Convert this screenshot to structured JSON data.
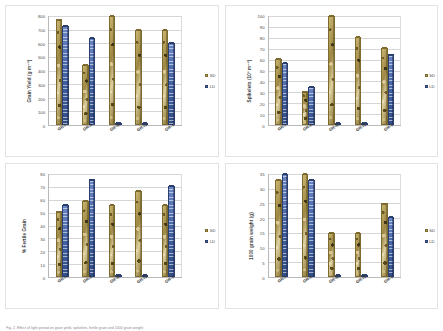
{
  "figure": {
    "caption": "Fig. 2. Effect of light period on grain yield, spikelets, fertile grain and 1000 grain weight",
    "legend": {
      "sd": "SD",
      "ld": "LD"
    },
    "categories": [
      "GR-I",
      "GR-II",
      "GR-III",
      "GR-IV",
      "GR-V"
    ],
    "colors": {
      "sd": "#b59a52",
      "ld": "#4a68a8",
      "grid": "#d6d6d6",
      "axis": "#b8b8b8"
    }
  },
  "chart_data": [
    {
      "type": "bar",
      "panel": "top-left",
      "title": "",
      "ylabel": "Grain Yield (g m⁻²)",
      "xlabel": "",
      "categories": [
        "GR-I",
        "GR-II",
        "GR-III",
        "GR-IV",
        "GR-V"
      ],
      "series": [
        {
          "name": "SD",
          "values": [
            775,
            440,
            800,
            700,
            700
          ]
        },
        {
          "name": "LD",
          "values": [
            730,
            640,
            5,
            5,
            605
          ]
        }
      ],
      "ylim": [
        0,
        800
      ],
      "yticks": [
        0,
        100,
        200,
        300,
        400,
        500,
        600,
        700,
        800
      ],
      "grid": true,
      "legend_position": "right"
    },
    {
      "type": "bar",
      "panel": "top-right",
      "title": "",
      "ylabel": "Spikelets (10³ m⁻²)",
      "xlabel": "",
      "categories": [
        "GR-I",
        "GR-II",
        "GR-III",
        "GR-IV",
        "GR-V"
      ],
      "series": [
        {
          "name": "SD",
          "values": [
            61,
            31,
            100,
            81,
            71
          ]
        },
        {
          "name": "LD",
          "values": [
            57,
            35,
            1,
            1,
            65
          ]
        }
      ],
      "ylim": [
        0,
        100
      ],
      "yticks": [
        0,
        10,
        20,
        30,
        40,
        50,
        60,
        70,
        80,
        90,
        100
      ],
      "grid": true,
      "legend_position": "right"
    },
    {
      "type": "bar",
      "panel": "bottom-left",
      "title": "",
      "ylabel": "% Fertile Grain",
      "xlabel": "",
      "categories": [
        "GR-I",
        "GR-II",
        "GR-III",
        "GR-IV",
        "GR-V"
      ],
      "series": [
        {
          "name": "SD",
          "values": [
            51,
            59,
            56,
            67,
            56
          ]
        },
        {
          "name": "LD",
          "values": [
            56,
            76,
            1,
            1,
            71
          ]
        }
      ],
      "ylim": [
        0,
        80
      ],
      "yticks": [
        0,
        10,
        20,
        30,
        40,
        50,
        60,
        70,
        80
      ],
      "grid": true,
      "legend_position": "right"
    },
    {
      "type": "bar",
      "panel": "bottom-right",
      "title": "",
      "ylabel": "1000 grain weight (g)",
      "xlabel": "",
      "categories": [
        "GR-I",
        "GR-II",
        "GR-III",
        "GR-IV",
        "GR-V"
      ],
      "series": [
        {
          "name": "SD",
          "values": [
            33,
            35,
            15,
            15,
            25
          ]
        },
        {
          "name": "LD",
          "values": [
            35,
            33,
            0.5,
            0.5,
            20.5
          ]
        }
      ],
      "ylim": [
        0,
        35
      ],
      "yticks": [
        0,
        5,
        10,
        15,
        20,
        25,
        30,
        35
      ],
      "grid": true,
      "legend_position": "right"
    }
  ]
}
